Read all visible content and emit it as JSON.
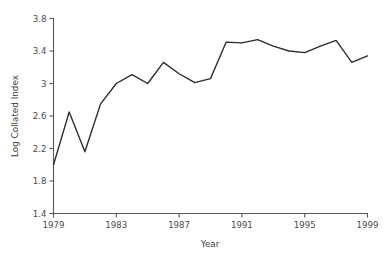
{
  "chart_data": {
    "type": "line",
    "title": "",
    "xlabel": "Year",
    "ylabel": "Log Collated Index",
    "xlim": [
      1979,
      1999
    ],
    "ylim": [
      1.4,
      3.8
    ],
    "grid": false,
    "legend": "none",
    "x_ticks": [
      "1979",
      "1983",
      "1987",
      "1991",
      "1995",
      "1999"
    ],
    "x_tick_values": [
      1979,
      1983,
      1987,
      1991,
      1995,
      1999
    ],
    "y_ticks": [
      "1.4",
      "1.8",
      "2.2",
      "2.6",
      "3",
      "3.4",
      "3.8"
    ],
    "y_tick_values": [
      1.4,
      1.8,
      2.2,
      2.6,
      3.0,
      3.4,
      3.8
    ],
    "x": [
      1979,
      1980,
      1981,
      1982,
      1983,
      1984,
      1985,
      1986,
      1987,
      1988,
      1989,
      1990,
      1991,
      1992,
      1993,
      1994,
      1995,
      1996,
      1997,
      1998,
      1999
    ],
    "values": [
      2.0,
      2.65,
      2.16,
      2.75,
      3.0,
      3.11,
      3.0,
      3.26,
      3.12,
      3.01,
      3.06,
      3.51,
      3.5,
      3.54,
      3.46,
      3.4,
      3.38,
      3.46,
      3.53,
      3.26,
      3.34
    ],
    "series": [
      {
        "name": "Log Collated Index",
        "color": "#2b2b2b",
        "values": [
          2.0,
          2.65,
          2.16,
          2.75,
          3.0,
          3.11,
          3.0,
          3.26,
          3.12,
          3.01,
          3.06,
          3.51,
          3.5,
          3.54,
          3.46,
          3.4,
          3.38,
          3.46,
          3.53,
          3.26,
          3.34
        ]
      }
    ]
  },
  "axes": {
    "x_title": "Year",
    "y_title": "Log Collated Index"
  },
  "colors": {
    "line": "#2b2b2b",
    "axis": "#58595b",
    "text": "#4a4a4c",
    "background": "#ffffff"
  }
}
